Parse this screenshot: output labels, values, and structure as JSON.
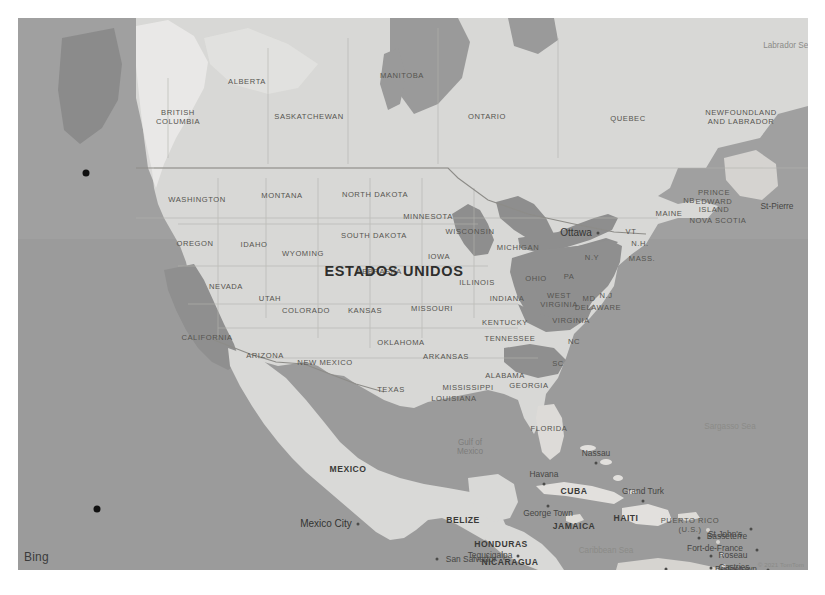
{
  "map": {
    "provider": "Bing",
    "attribution": "© 2021 TomTom",
    "base_color": "#9b9b9b",
    "land_color": "#d8d8d6",
    "highlight_color": "#8f8f8f",
    "label_color": "#4a4a4a"
  },
  "highlighted_regions": [
    "California",
    "Ohio",
    "Pennsylvania",
    "West Virginia",
    "Virginia",
    "Maryland",
    "Delaware",
    "New Jersey",
    "Alaska Panhandle"
  ],
  "labels": {
    "countries": [
      {
        "name": "ESTADOS UNIDOS",
        "x": 376,
        "y": 253,
        "class": "country-big"
      },
      {
        "name": "MEXICO",
        "x": 330,
        "y": 452,
        "class": "country"
      },
      {
        "name": "BELIZE",
        "x": 445,
        "y": 503,
        "class": "country"
      },
      {
        "name": "HONDURAS",
        "x": 483,
        "y": 527,
        "class": "country"
      },
      {
        "name": "NICARAGUA",
        "x": 492,
        "y": 545,
        "class": "country"
      },
      {
        "name": "CUBA",
        "x": 556,
        "y": 474,
        "class": "country"
      },
      {
        "name": "HAITI",
        "x": 608,
        "y": 501,
        "class": "country"
      },
      {
        "name": "JAMAICA",
        "x": 556,
        "y": 509,
        "class": "country"
      }
    ],
    "admin1": [
      {
        "name": "BRITISH\nCOLUMBIA",
        "x": 160,
        "y": 100
      },
      {
        "name": "ALBERTA",
        "x": 229,
        "y": 64
      },
      {
        "name": "SASKATCHEWAN",
        "x": 291,
        "y": 99
      },
      {
        "name": "MANITOBA",
        "x": 384,
        "y": 58
      },
      {
        "name": "ONTARIO",
        "x": 469,
        "y": 99
      },
      {
        "name": "QUEBEC",
        "x": 610,
        "y": 101
      },
      {
        "name": "NEWFOUNDLAND\nAND LABRADOR",
        "x": 723,
        "y": 100
      },
      {
        "name": "PRINCE\nEDWARD\nISLAND",
        "x": 696,
        "y": 184
      },
      {
        "name": "NOVA SCOTIA",
        "x": 700,
        "y": 203
      },
      {
        "name": "NB",
        "x": 671,
        "y": 183
      },
      {
        "name": "MAINE",
        "x": 651,
        "y": 196
      },
      {
        "name": "WASHINGTON",
        "x": 179,
        "y": 182
      },
      {
        "name": "MONTANA",
        "x": 264,
        "y": 178
      },
      {
        "name": "NORTH DAKOTA",
        "x": 357,
        "y": 177
      },
      {
        "name": "OREGON",
        "x": 177,
        "y": 226
      },
      {
        "name": "IDAHO",
        "x": 236,
        "y": 227
      },
      {
        "name": "SOUTH DAKOTA",
        "x": 356,
        "y": 218
      },
      {
        "name": "MINNESOTA",
        "x": 410,
        "y": 199
      },
      {
        "name": "WYOMING",
        "x": 285,
        "y": 236
      },
      {
        "name": "WISCONSIN",
        "x": 452,
        "y": 214
      },
      {
        "name": "MICHIGAN",
        "x": 500,
        "y": 230
      },
      {
        "name": "IOWA",
        "x": 421,
        "y": 239
      },
      {
        "name": "NEBRASKA",
        "x": 361,
        "y": 254
      },
      {
        "name": "NEVADA",
        "x": 208,
        "y": 269
      },
      {
        "name": "UTAH",
        "x": 252,
        "y": 281
      },
      {
        "name": "ILLINOIS",
        "x": 459,
        "y": 265
      },
      {
        "name": "INDIANA",
        "x": 489,
        "y": 281
      },
      {
        "name": "OHIO",
        "x": 518,
        "y": 261
      },
      {
        "name": "PA",
        "x": 551,
        "y": 259
      },
      {
        "name": "N.Y",
        "x": 574,
        "y": 240
      },
      {
        "name": "VT",
        "x": 613,
        "y": 214
      },
      {
        "name": "N.H.",
        "x": 622,
        "y": 226
      },
      {
        "name": "MASS.",
        "x": 624,
        "y": 241
      },
      {
        "name": "N.J",
        "x": 588,
        "y": 278
      },
      {
        "name": "COLORADO",
        "x": 288,
        "y": 293
      },
      {
        "name": "KANSAS",
        "x": 347,
        "y": 293
      },
      {
        "name": "MISSOURI",
        "x": 414,
        "y": 291
      },
      {
        "name": "KENTUCKY",
        "x": 487,
        "y": 305
      },
      {
        "name": "WEST\nVIRGINIA",
        "x": 541,
        "y": 283
      },
      {
        "name": "MD",
        "x": 571,
        "y": 281
      },
      {
        "name": "DELAWARE",
        "x": 580,
        "y": 290
      },
      {
        "name": "VIRGINIA",
        "x": 553,
        "y": 303
      },
      {
        "name": "CALIFORNIA",
        "x": 189,
        "y": 320
      },
      {
        "name": "ARIZONA",
        "x": 247,
        "y": 338
      },
      {
        "name": "NEW MEXICO",
        "x": 307,
        "y": 345
      },
      {
        "name": "OKLAHOMA",
        "x": 383,
        "y": 325
      },
      {
        "name": "ARKANSAS",
        "x": 428,
        "y": 339
      },
      {
        "name": "TENNESSEE",
        "x": 492,
        "y": 321
      },
      {
        "name": "NC",
        "x": 556,
        "y": 324
      },
      {
        "name": "SC",
        "x": 540,
        "y": 346
      },
      {
        "name": "TEXAS",
        "x": 373,
        "y": 372
      },
      {
        "name": "MISSISSIPPI",
        "x": 450,
        "y": 370
      },
      {
        "name": "ALABAMA",
        "x": 487,
        "y": 358
      },
      {
        "name": "GEORGIA",
        "x": 511,
        "y": 368
      },
      {
        "name": "LOUISIANA",
        "x": 436,
        "y": 381
      },
      {
        "name": "FLORIDA",
        "x": 531,
        "y": 411
      },
      {
        "name": "PUERTO RICO\n(U.S.)",
        "x": 672,
        "y": 508
      }
    ],
    "cities": [
      {
        "name": "Ottawa",
        "x": 580,
        "y": 215,
        "class": "city-major",
        "dot": true,
        "dx": -22,
        "dy": 0
      },
      {
        "name": "St-Pierre",
        "x": 759,
        "y": 189,
        "class": "city",
        "dot": false
      },
      {
        "name": "Mexico City",
        "x": 340,
        "y": 506,
        "class": "city-major",
        "dot": true,
        "dx": -32,
        "dy": 0
      },
      {
        "name": "Havana",
        "x": 526,
        "y": 466,
        "class": "city",
        "dot": true,
        "dx": 0,
        "dy": -9
      },
      {
        "name": "Nassau",
        "x": 578,
        "y": 445,
        "class": "city",
        "dot": true,
        "dx": 0,
        "dy": -9
      },
      {
        "name": "George Town",
        "x": 530,
        "y": 488,
        "class": "city",
        "dot": true,
        "dx": 0,
        "dy": 8
      },
      {
        "name": "Grand Turk",
        "x": 625,
        "y": 483,
        "class": "city",
        "dot": true,
        "dx": 0,
        "dy": -9
      },
      {
        "name": "Tegucigalpa",
        "x": 500,
        "y": 538,
        "class": "city",
        "dot": true,
        "dx": -28,
        "dy": 0
      },
      {
        "name": "San Salvador",
        "x": 419,
        "y": 541,
        "class": "city",
        "dot": true,
        "dx": 34,
        "dy": 1
      },
      {
        "name": "Basseterre",
        "x": 681,
        "y": 520,
        "class": "city",
        "dot": true,
        "dx": 28,
        "dy": -1
      },
      {
        "name": "St John's",
        "x": 733,
        "y": 511,
        "class": "city",
        "dot": true,
        "dx": -26,
        "dy": 6
      },
      {
        "name": "Fort-de-France",
        "x": 739,
        "y": 532,
        "class": "city",
        "dot": true,
        "dx": -42,
        "dy": -1
      },
      {
        "name": "Roseau",
        "x": 693,
        "y": 538,
        "class": "city",
        "dot": true,
        "dx": 22,
        "dy": 0
      },
      {
        "name": "Castries",
        "x": 693,
        "y": 550,
        "class": "city",
        "dot": true,
        "dx": 23,
        "dy": 0
      },
      {
        "name": "Bridgetown",
        "x": 750,
        "y": 552,
        "class": "city",
        "dot": true,
        "dx": -32,
        "dy": 0
      },
      {
        "name": "St. George's",
        "x": 729,
        "y": 568,
        "class": "city",
        "dot": true,
        "dx": -32,
        "dy": -8
      },
      {
        "name": "Willemstad",
        "x": 648,
        "y": 551,
        "class": "city",
        "dot": true,
        "dx": 0,
        "dy": 10
      }
    ],
    "water": [
      {
        "name": "Labrador Sea",
        "x": 770,
        "y": 28,
        "class": "water-lbl-lt"
      },
      {
        "name": "Gulf of\nMexico",
        "x": 452,
        "y": 429,
        "class": "water-lbl"
      },
      {
        "name": "Sargasso Sea",
        "x": 712,
        "y": 409,
        "class": "water-lbl-lt"
      },
      {
        "name": "Caribbean Sea",
        "x": 588,
        "y": 533,
        "class": "water-lbl-lt"
      }
    ],
    "markers": [
      {
        "name": "pacific-marker-north",
        "x": 68,
        "y": 155
      },
      {
        "name": "pacific-marker-south",
        "x": 79,
        "y": 491
      }
    ]
  }
}
